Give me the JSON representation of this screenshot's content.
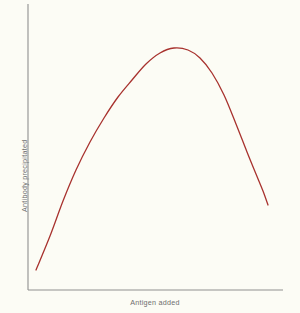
{
  "chart_data": {
    "type": "line",
    "title": "",
    "subtitle": "",
    "xlabel": "Antigen added",
    "ylabel": "Antibody precipitated",
    "legend": [],
    "legend_position": "none",
    "grid": false,
    "axis_style": "open-left-bottom",
    "xlim": [
      0,
      1
    ],
    "ylim": [
      0,
      1
    ],
    "x_ticks": [],
    "y_ticks": [],
    "x_tick_labels": [],
    "y_tick_labels": [],
    "annotations": [],
    "series": [
      {
        "name": "Precipitin curve",
        "color": "#a8322e",
        "line_width": 1.3,
        "x": [
          0.03,
          0.08,
          0.14,
          0.2,
          0.27,
          0.34,
          0.41,
          0.48,
          0.55,
          0.62,
          0.69,
          0.76,
          0.82,
          0.88,
          0.94,
          1.0
        ],
        "y": [
          0.07,
          0.23,
          0.41,
          0.57,
          0.71,
          0.82,
          0.9,
          0.95,
          0.97,
          0.95,
          0.89,
          0.78,
          0.63,
          0.48,
          0.38,
          0.32
        ]
      }
    ],
    "path_points_px": [
      [
        36,
        270
      ],
      [
        50,
        236
      ],
      [
        63,
        201
      ],
      [
        76,
        170
      ],
      [
        90,
        142
      ],
      [
        104,
        118
      ],
      [
        118,
        97
      ],
      [
        132,
        80
      ],
      [
        146,
        64
      ],
      [
        160,
        53
      ],
      [
        174,
        48
      ],
      [
        188,
        50
      ],
      [
        200,
        58
      ],
      [
        212,
        73
      ],
      [
        224,
        95
      ],
      [
        236,
        124
      ],
      [
        247,
        152
      ],
      [
        256,
        174
      ],
      [
        263,
        191
      ],
      [
        268,
        205
      ]
    ]
  },
  "axes": {
    "color": "#8f8f8f",
    "y_axis_x": 28,
    "y_axis_top": 4,
    "y_axis_bottom": 290,
    "x_axis_y": 290,
    "x_axis_left": 28,
    "x_axis_right": 283
  },
  "canvas": {
    "background": "#fcfcf5",
    "width": 300,
    "height": 313
  }
}
